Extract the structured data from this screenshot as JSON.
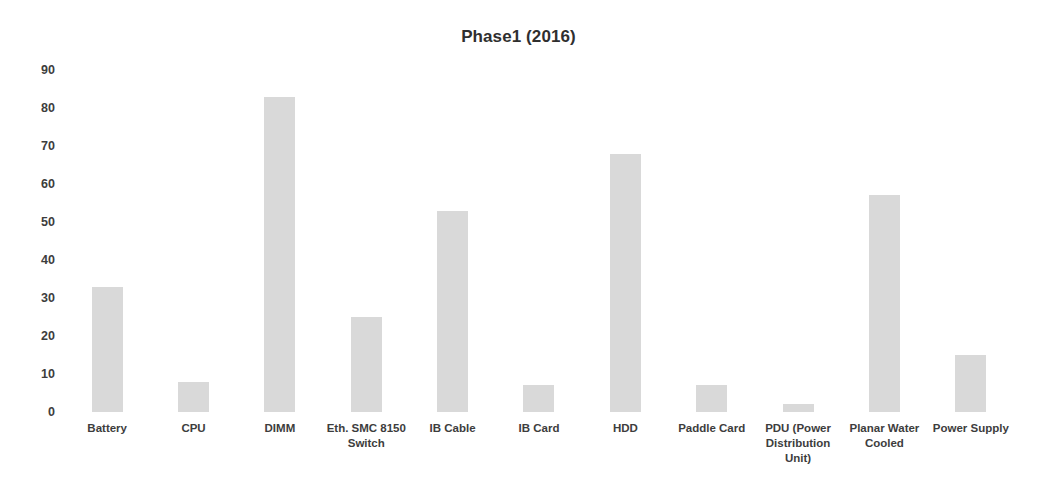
{
  "top_cut_text": ". . . , . . .",
  "chart_data": {
    "type": "bar",
    "title": "Phase1 (2016)",
    "xlabel": "",
    "ylabel": "",
    "ylim": [
      0,
      90
    ],
    "ytick_step": 10,
    "yticks": [
      "90",
      "80",
      "70",
      "60",
      "50",
      "40",
      "30",
      "20",
      "10",
      "0"
    ],
    "grid": false,
    "legend": "none",
    "bar_color": "#d9d9d9",
    "categories": [
      "Battery",
      "CPU",
      "DIMM",
      "Eth. SMC 8150 Switch",
      "IB Cable",
      "IB Card",
      "HDD",
      "Paddle Card",
      "PDU (Power Distribution Unit)",
      "Planar Water Cooled",
      "Power Supply"
    ],
    "values": [
      33,
      8,
      83,
      25,
      53,
      7,
      68,
      7,
      2,
      57,
      15
    ]
  }
}
